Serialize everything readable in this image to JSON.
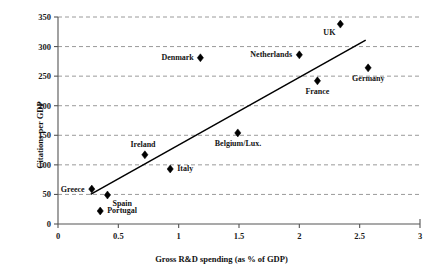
{
  "chart_data": {
    "type": "scatter",
    "title": "",
    "xlabel": "Gross R&D spending (as % of GDP)",
    "ylabel": "Citations per GDP",
    "xlim": [
      0,
      3
    ],
    "ylim": [
      0,
      350
    ],
    "xticks": [
      "0",
      "0.5",
      "1",
      "1.5",
      "2",
      "2.5",
      "3"
    ],
    "xtick_values": [
      0,
      0.5,
      1,
      1.5,
      2,
      2.5,
      3
    ],
    "yticks": [
      "0",
      "50",
      "100",
      "150",
      "200",
      "250",
      "300",
      "350"
    ],
    "ytick_values": [
      0,
      50,
      100,
      150,
      200,
      250,
      300,
      350
    ],
    "grid": "horizontal-dashed",
    "legend": "none",
    "marker": "diamond",
    "marker_color": "#000000",
    "points": [
      {
        "label": "Greece",
        "x": 0.28,
        "y": 59,
        "label_pos": "left"
      },
      {
        "label": "Portugal",
        "x": 0.35,
        "y": 22,
        "label_pos": "right"
      },
      {
        "label": "Spain",
        "x": 0.41,
        "y": 49,
        "label_pos": "below-right"
      },
      {
        "label": "Ireland",
        "x": 0.72,
        "y": 117,
        "label_pos": "above-left"
      },
      {
        "label": "Italy",
        "x": 0.93,
        "y": 93,
        "label_pos": "right"
      },
      {
        "label": "Denmark",
        "x": 1.18,
        "y": 281,
        "label_pos": "left"
      },
      {
        "label": "Belgium/Lux.",
        "x": 1.49,
        "y": 154,
        "label_pos": "below"
      },
      {
        "label": "Netherlands",
        "x": 2.0,
        "y": 286,
        "label_pos": "left"
      },
      {
        "label": "France",
        "x": 2.15,
        "y": 242,
        "label_pos": "below"
      },
      {
        "label": "UK",
        "x": 2.34,
        "y": 338,
        "label_pos": "below-left"
      },
      {
        "label": "Germany",
        "x": 2.57,
        "y": 264,
        "label_pos": "below"
      }
    ],
    "trendline": {
      "type": "linear-fit",
      "x_start": 0.27,
      "y_start": 50,
      "x_end": 2.55,
      "y_end": 311,
      "color": "#000000"
    }
  }
}
